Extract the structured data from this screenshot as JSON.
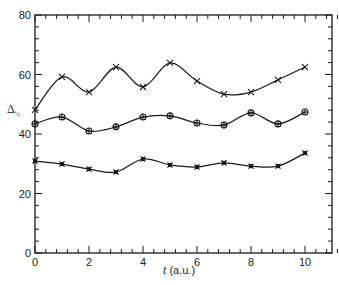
{
  "chart_data": {
    "type": "line",
    "title": "",
    "xlabel": "t (a.u.)",
    "xlabel_italic_part": "t",
    "xlabel_rest": " (a.u.)",
    "ylabel": "Δ½",
    "ylabel_main": "Δ",
    "ylabel_sub": "½",
    "xlim": [
      0,
      11
    ],
    "ylim": [
      0,
      80
    ],
    "x_ticks": [
      0,
      2,
      4,
      6,
      8,
      10
    ],
    "x_tick_labels": [
      "0",
      "2",
      "4",
      "6",
      "8",
      "10"
    ],
    "x_minor_step": 0.4,
    "y_ticks": [
      0,
      20,
      40,
      60,
      80
    ],
    "y_tick_labels": [
      "0",
      "20",
      "40",
      "60",
      "80"
    ],
    "y_minor_step": 4,
    "grid": false,
    "legend": null,
    "x": [
      0,
      1,
      2,
      3,
      4,
      5,
      6,
      7,
      8,
      9,
      10
    ],
    "series": [
      {
        "name": "upper",
        "marker": "cross",
        "values": [
          48.1,
          59.2,
          54.1,
          62.5,
          55.8,
          63.9,
          57.8,
          53.4,
          54.1,
          58.2,
          62.5
        ]
      },
      {
        "name": "middle",
        "marker": "circle-plus",
        "values": [
          43.4,
          45.7,
          41.0,
          42.4,
          45.7,
          46.1,
          43.7,
          43.0,
          47.1,
          43.4,
          47.4
        ]
      },
      {
        "name": "lower",
        "marker": "filled-cross",
        "values": [
          30.9,
          29.9,
          28.2,
          27.2,
          31.6,
          29.6,
          28.9,
          30.3,
          29.2,
          29.2,
          33.6
        ]
      }
    ]
  }
}
